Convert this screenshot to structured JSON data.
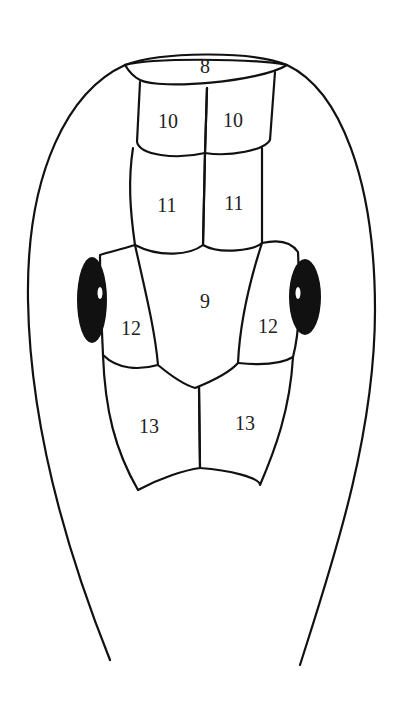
{
  "diagram": {
    "scales": [
      {
        "id": "s8",
        "label": "8"
      },
      {
        "id": "s10l",
        "label": "10"
      },
      {
        "id": "s10r",
        "label": "10"
      },
      {
        "id": "s11l",
        "label": "11"
      },
      {
        "id": "s11r",
        "label": "11"
      },
      {
        "id": "s9",
        "label": "9"
      },
      {
        "id": "s12l",
        "label": "12"
      },
      {
        "id": "s12r",
        "label": "12"
      },
      {
        "id": "s13l",
        "label": "13"
      },
      {
        "id": "s13r",
        "label": "13"
      }
    ],
    "line_color": "#111111",
    "eye_color": "#111111"
  }
}
